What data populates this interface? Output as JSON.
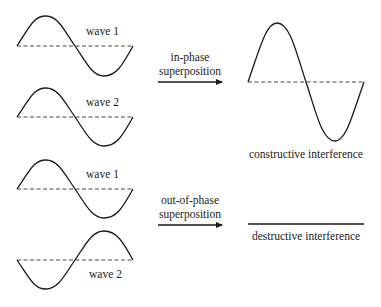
{
  "in_phase": {
    "wave1_label": "wave 1",
    "wave2_label": "wave 2",
    "arrow_label_line1": "in-phase",
    "arrow_label_line2": "superposition",
    "result_label": "constructive interference"
  },
  "out_of_phase": {
    "wave1_label": "wave 1",
    "wave2_label": "wave 2",
    "arrow_label_line1": "out-of-phase",
    "arrow_label_line2": "superposition",
    "result_label": "destructive interference"
  },
  "colors": {
    "stroke": "#1a1a1a",
    "text": "#222222",
    "background": "#ffffff"
  }
}
